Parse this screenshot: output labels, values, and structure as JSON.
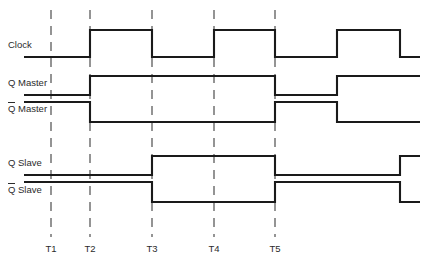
{
  "figure": {
    "kind": "timing-diagram",
    "width": 433,
    "height": 268,
    "background_color": "#ffffff",
    "wave_color": "#1a1a1a",
    "marker_color": "#555555",
    "text_color": "#2b2b2b"
  },
  "time_axis": {
    "markers": [
      {
        "label": "T1",
        "x": 51
      },
      {
        "label": "T2",
        "x": 90
      },
      {
        "label": "T3",
        "x": 152
      },
      {
        "label": "T4",
        "x": 214
      },
      {
        "label": "T5",
        "x": 275
      }
    ],
    "marker_top_y": 10,
    "marker_bottom_y": 237,
    "label_y": 252
  },
  "signals": [
    {
      "name": "clock",
      "label": "Clock",
      "has_overbar": false,
      "label_x": 8,
      "label_y": 45,
      "high_y": 30,
      "low_y": 57,
      "start_x": 24,
      "end_x": 420,
      "initial_level": "low",
      "transitions": [
        {
          "x": 90,
          "to": "high"
        },
        {
          "x": 152,
          "to": "low"
        },
        {
          "x": 214,
          "to": "high"
        },
        {
          "x": 275,
          "to": "low"
        },
        {
          "x": 337,
          "to": "high"
        },
        {
          "x": 400,
          "to": "low"
        }
      ]
    },
    {
      "name": "q-master",
      "label": "Q Master",
      "has_overbar": false,
      "label_x": 8,
      "label_y": 83,
      "high_y": 76,
      "low_y": 95,
      "start_x": 24,
      "end_x": 420,
      "initial_level": "low",
      "transitions": [
        {
          "x": 90,
          "to": "high"
        },
        {
          "x": 275,
          "to": "low"
        },
        {
          "x": 337,
          "to": "high"
        }
      ]
    },
    {
      "name": "q-master-bar",
      "label": "Q Master",
      "has_overbar": true,
      "label_x": 8,
      "label_y": 109,
      "high_y": 102,
      "low_y": 122,
      "start_x": 24,
      "end_x": 420,
      "initial_level": "high",
      "transitions": [
        {
          "x": 90,
          "to": "low"
        },
        {
          "x": 275,
          "to": "high"
        },
        {
          "x": 337,
          "to": "low"
        }
      ]
    },
    {
      "name": "q-slave",
      "label": "Q Slave",
      "has_overbar": false,
      "label_x": 8,
      "label_y": 163,
      "high_y": 156,
      "low_y": 175,
      "start_x": 24,
      "end_x": 420,
      "initial_level": "low",
      "transitions": [
        {
          "x": 152,
          "to": "high"
        },
        {
          "x": 275,
          "to": "low"
        },
        {
          "x": 400,
          "to": "high"
        }
      ]
    },
    {
      "name": "q-slave-bar",
      "label": "Q Slave",
      "has_overbar": true,
      "label_x": 8,
      "label_y": 190,
      "high_y": 182,
      "low_y": 202,
      "start_x": 24,
      "end_x": 420,
      "initial_level": "high",
      "transitions": [
        {
          "x": 152,
          "to": "low"
        },
        {
          "x": 275,
          "to": "high"
        },
        {
          "x": 400,
          "to": "low"
        }
      ]
    }
  ]
}
